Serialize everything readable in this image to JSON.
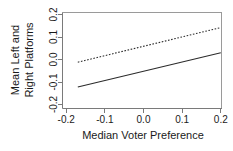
{
  "chart_data": {
    "type": "line",
    "title": "",
    "xlabel": "Median Voter Preference",
    "ylabel": "Mean Left and Right Platforms",
    "ylabel_line1": "Mean Left and",
    "ylabel_line2": "Right Platforms",
    "xlim": [
      -0.2,
      0.2
    ],
    "ylim": [
      -0.2,
      0.2
    ],
    "xticks": [
      -0.2,
      -0.1,
      0.0,
      0.1,
      0.2
    ],
    "yticks": [
      -0.2,
      -0.1,
      0.0,
      0.1,
      0.2
    ],
    "xticklabels": [
      "-0.2",
      "-0.1",
      "0.0",
      "0.1",
      "0.2"
    ],
    "yticklabels": [
      "-0.2",
      "-0.1",
      "0.0",
      "0.1",
      "0.2"
    ],
    "grid": false,
    "legend": "none",
    "frame": "box",
    "series": [
      {
        "name": "right-platform",
        "style": "dashed",
        "color": "#2b2b2b",
        "x": [
          -0.17,
          0.2
        ],
        "values": [
          -0.012,
          0.142
        ]
      },
      {
        "name": "left-platform",
        "style": "solid",
        "color": "#2b2b2b",
        "x": [
          -0.17,
          0.2
        ],
        "values": [
          -0.122,
          0.03
        ]
      }
    ]
  },
  "axes": {
    "x_tick_0": "-0.2",
    "x_tick_1": "-0.1",
    "x_tick_2": "0.0",
    "x_tick_3": "0.1",
    "x_tick_4": "0.2",
    "y_tick_0": "0.2",
    "y_tick_1": "0.1",
    "y_tick_2": "0.0",
    "y_tick_3": "-0.1",
    "y_tick_4": "-0.2"
  }
}
